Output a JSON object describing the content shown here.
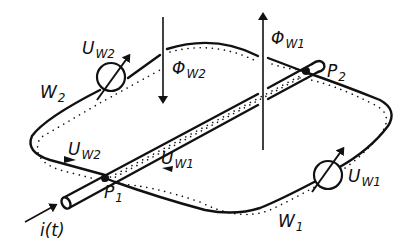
{
  "diagram": {
    "type": "electromagnetic coupling schematic",
    "colors": {
      "ink": "#111111",
      "background": "#ffffff"
    },
    "labels": {
      "u_w2_top": {
        "main": "U",
        "sub": "W2"
      },
      "phi_w2": {
        "main": "Φ",
        "sub": "W2"
      },
      "phi_w1": {
        "main": "Φ",
        "sub": "W1"
      },
      "p2": {
        "main": "P",
        "sub": "2"
      },
      "w2": {
        "main": "W",
        "sub": "2"
      },
      "u_w2_bottom": {
        "main": "U",
        "sub": "W2"
      },
      "p1": {
        "main": "P",
        "sub": "1"
      },
      "u_w1_bottom": {
        "main": "U",
        "sub": "W1"
      },
      "u_w1_right": {
        "main": "U",
        "sub": "W1"
      },
      "w1": {
        "main": "W",
        "sub": "1"
      },
      "current": "i(t)"
    },
    "elements": [
      {
        "id": "conductor",
        "kind": "cylindrical conductor",
        "from": "lower-left",
        "to": "upper-right"
      },
      {
        "id": "loop",
        "kind": "closed conductor loop",
        "crossings": [
          "P1",
          "P2"
        ]
      },
      {
        "id": "mesh-w1",
        "kind": "dotted mesh path",
        "label": "W1"
      },
      {
        "id": "mesh-w2",
        "kind": "dotted mesh path",
        "label": "W2"
      },
      {
        "id": "source-uw1",
        "kind": "voltage source symbol",
        "label": "UW1"
      },
      {
        "id": "source-uw2",
        "kind": "voltage source symbol",
        "label": "UW2"
      },
      {
        "id": "flux-w1",
        "kind": "flux arrow",
        "direction": "up",
        "label": "ΦW1"
      },
      {
        "id": "flux-w2",
        "kind": "flux arrow",
        "direction": "down",
        "label": "ΦW2"
      },
      {
        "id": "current-arrow",
        "kind": "current arrow",
        "label": "i(t)"
      }
    ]
  }
}
